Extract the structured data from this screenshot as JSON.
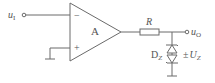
{
  "diagram": {
    "type": "op-amp voltage limiter circuit",
    "input_label": "u",
    "input_sub": "I",
    "output_label": "u",
    "output_sub": "O",
    "opamp_label": "A",
    "inverting_sign": "−",
    "noninverting_sign": "+",
    "resistor_label": "R",
    "zener_label": "D",
    "zener_sub": "Z",
    "zener_voltage_prefix": "±",
    "zener_voltage_label": "U",
    "zener_voltage_sub": "Z",
    "colors": {
      "line": "#6a6a6a",
      "text": "#555555",
      "background": "#ffffff"
    }
  }
}
